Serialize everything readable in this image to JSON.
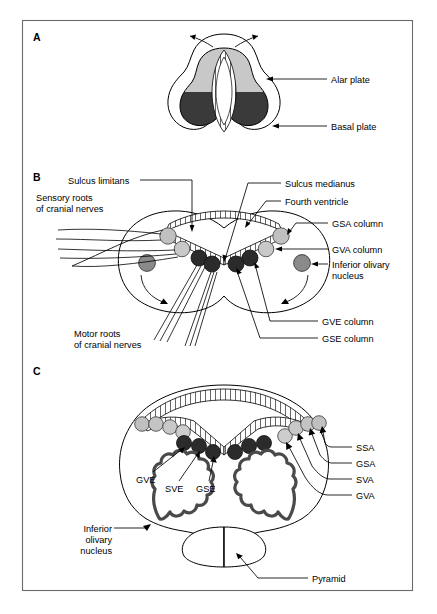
{
  "figure": {
    "background_color": "#ffffff",
    "frame_color": "#6b6b6b"
  },
  "colors": {
    "alar_plate": "#c8c8c8",
    "basal_plate": "#3a3a3a",
    "nucleus_light": "#c0c0c0",
    "nucleus_mid": "#8a8a8a",
    "nucleus_dark": "#2b2b2b",
    "olive_outline": "#4a4a4a",
    "line": "#000000"
  },
  "panels": [
    {
      "id": "A",
      "letter": "A",
      "labels": [
        {
          "id": "alar-plate",
          "text": "Alar plate"
        },
        {
          "id": "basal-plate",
          "text": "Basal plate"
        }
      ],
      "regions": [
        {
          "id": "alar-plate-region",
          "name": "Alar plate",
          "shade": "light"
        },
        {
          "id": "basal-plate-region",
          "name": "Basal plate",
          "shade": "dark"
        },
        {
          "id": "central-canal",
          "name": "Central canal",
          "shade": "white"
        }
      ],
      "arrows": [
        {
          "id": "evagination-arrow-left",
          "name": "alar plate eversion arrow, left"
        },
        {
          "id": "evagination-arrow-right",
          "name": "alar plate eversion arrow, right"
        }
      ]
    },
    {
      "id": "B",
      "letter": "B",
      "labels": [
        {
          "id": "sulcus-limitans",
          "text": "Sulcus limitans"
        },
        {
          "id": "sulcus-medianus",
          "text": "Sulcus medianus"
        },
        {
          "id": "fourth-ventricle",
          "text": "Fourth ventricle"
        },
        {
          "id": "sensory-roots-line1",
          "text": "Sensory roots"
        },
        {
          "id": "sensory-roots-line2",
          "text": "of cranial nerves"
        },
        {
          "id": "motor-roots-line1",
          "text": "Motor roots"
        },
        {
          "id": "motor-roots-line2",
          "text": "of cranial nerves"
        },
        {
          "id": "gsa-column",
          "text": "GSA column"
        },
        {
          "id": "gva-column",
          "text": "GVA column"
        },
        {
          "id": "inferior-olivary-line1",
          "text": "Inferior olivary"
        },
        {
          "id": "inferior-olivary-line2",
          "text": "nucleus"
        },
        {
          "id": "gve-column",
          "text": "GVE column"
        },
        {
          "id": "gse-column",
          "text": "GSE column"
        }
      ],
      "nuclei": [
        {
          "id": "b-gsa-left",
          "shade": "light",
          "side": "left"
        },
        {
          "id": "b-gva-left",
          "shade": "light",
          "side": "left"
        },
        {
          "id": "b-gve-left",
          "shade": "dark",
          "side": "left"
        },
        {
          "id": "b-gse-left",
          "shade": "dark",
          "side": "left"
        },
        {
          "id": "b-olive-left",
          "shade": "mid",
          "side": "left"
        },
        {
          "id": "b-gsa-right",
          "shade": "light",
          "side": "right"
        },
        {
          "id": "b-gva-right",
          "shade": "light",
          "side": "right"
        },
        {
          "id": "b-gve-right",
          "shade": "dark",
          "side": "right"
        },
        {
          "id": "b-gse-right",
          "shade": "dark",
          "side": "right"
        },
        {
          "id": "b-olive-right",
          "shade": "mid",
          "side": "right"
        }
      ]
    },
    {
      "id": "C",
      "letter": "C",
      "labels": [
        {
          "id": "gve",
          "text": "GVE"
        },
        {
          "id": "sve",
          "text": "SVE"
        },
        {
          "id": "gse",
          "text": "GSE"
        },
        {
          "id": "ssa",
          "text": "SSA"
        },
        {
          "id": "gsa",
          "text": "GSA"
        },
        {
          "id": "sva",
          "text": "SVA"
        },
        {
          "id": "gva",
          "text": "GVA"
        },
        {
          "id": "inferior-olivary-line1",
          "text": "Inferior"
        },
        {
          "id": "inferior-olivary-line2",
          "text": "olivary"
        },
        {
          "id": "inferior-olivary-line3",
          "text": "nucleus"
        },
        {
          "id": "pyramid",
          "text": "Pyramid"
        }
      ],
      "nuclei_columns": [
        {
          "id": "c-ssa",
          "label": "SSA",
          "shade": "light"
        },
        {
          "id": "c-gsa",
          "label": "GSA",
          "shade": "light"
        },
        {
          "id": "c-sva",
          "label": "SVA",
          "shade": "light"
        },
        {
          "id": "c-gva",
          "label": "GVA",
          "shade": "light"
        },
        {
          "id": "c-gve",
          "label": "GVE",
          "shade": "dark"
        },
        {
          "id": "c-sve",
          "label": "SVE",
          "shade": "dark"
        },
        {
          "id": "c-gse",
          "label": "GSE",
          "shade": "dark"
        }
      ],
      "structures": [
        {
          "id": "inferior-olivary-nucleus-left",
          "name": "Inferior olivary nucleus, left"
        },
        {
          "id": "inferior-olivary-nucleus-right",
          "name": "Inferior olivary nucleus, right"
        },
        {
          "id": "pyramid-left",
          "name": "Pyramid, left"
        },
        {
          "id": "pyramid-right",
          "name": "Pyramid, right"
        }
      ]
    }
  ]
}
